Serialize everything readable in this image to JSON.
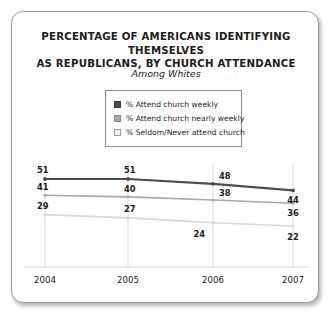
{
  "chart_data": {
    "type": "line",
    "title": "PERCENTAGE OF AMERICANS IDENTIFYING THEMSELVES AS REPUBLICANS, BY CHURCH ATTENDANCE",
    "title_line1": "PERCENTAGE OF AMERICANS IDENTIFYING THEMSELVES",
    "title_line2": "AS REPUBLICANS, BY CHURCH ATTENDANCE",
    "subtitle": "Among Whites",
    "xlabel": "",
    "ylabel": "",
    "categories": [
      "2004",
      "2005",
      "2006",
      "2007"
    ],
    "x": [
      2004,
      2005,
      2006,
      2007
    ],
    "ylim": [
      0,
      60
    ],
    "grid": "vertical",
    "legend_position": "top-center",
    "series": [
      {
        "name": "% Attend church weekly",
        "color": "#4d4d4d",
        "values": [
          51,
          51,
          48,
          44
        ],
        "labels": [
          "51",
          "51",
          "48",
          "44"
        ]
      },
      {
        "name": "% Attend church nearly weekly",
        "color": "#a8a8a8",
        "values": [
          41,
          40,
          38,
          36
        ],
        "labels": [
          "41",
          "40",
          "38",
          "36"
        ]
      },
      {
        "name": "% Seldom/Never attend church",
        "color": "#d8d8d8",
        "values": [
          29,
          27,
          24,
          22
        ],
        "labels": [
          "29",
          "27",
          "24",
          "22"
        ]
      }
    ]
  },
  "legend": {
    "items": [
      {
        "label": "% Attend church weekly",
        "swatch": "#4d4d4d",
        "border": "#3a3a3a"
      },
      {
        "label": "% Attend church nearly weekly",
        "swatch": "#a8a8a8",
        "border": "#8a8a8a"
      },
      {
        "label": "% Seldom/Never attend church",
        "swatch": "#ededed",
        "border": "#9e9e9e"
      }
    ]
  },
  "axis": {
    "x_ticks": [
      "2004",
      "2005",
      "2006",
      "2007"
    ]
  }
}
